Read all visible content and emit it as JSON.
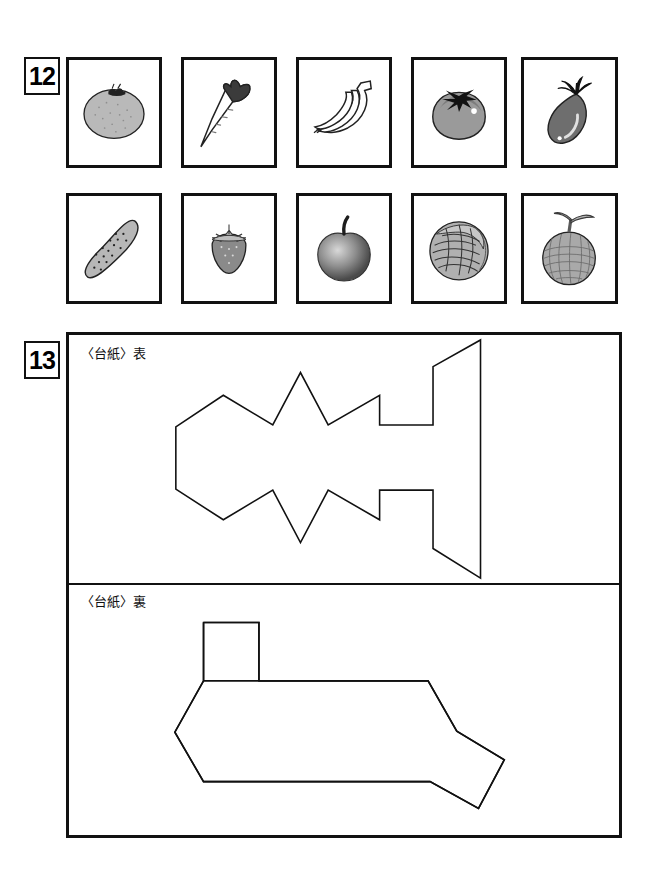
{
  "page": {
    "width": 650,
    "height": 890,
    "background": "#ffffff",
    "ink": "#111111"
  },
  "questions": [
    {
      "number": "12",
      "type": "picture-card-grid",
      "rows": 2,
      "columns": 5,
      "cards": [
        {
          "id": "card-orange",
          "icon": "orange-icon",
          "label": "orange",
          "row": 1,
          "col": 1
        },
        {
          "id": "card-carrot",
          "icon": "carrot-icon",
          "label": "carrot",
          "row": 1,
          "col": 2
        },
        {
          "id": "card-bananas",
          "icon": "bananas-icon",
          "label": "bananas",
          "row": 1,
          "col": 3
        },
        {
          "id": "card-tomato",
          "icon": "tomato-icon",
          "label": "tomato",
          "row": 1,
          "col": 4
        },
        {
          "id": "card-eggplant",
          "icon": "eggplant-icon",
          "label": "eggplant",
          "row": 1,
          "col": 5
        },
        {
          "id": "card-cucumber",
          "icon": "cucumber-icon",
          "label": "cucumber",
          "row": 2,
          "col": 1
        },
        {
          "id": "card-strawberry",
          "icon": "strawberry-icon",
          "label": "strawberry",
          "row": 2,
          "col": 2
        },
        {
          "id": "card-apple",
          "icon": "apple-icon",
          "label": "apple",
          "row": 2,
          "col": 3
        },
        {
          "id": "card-cabbage",
          "icon": "cabbage-icon",
          "label": "cabbage",
          "row": 2,
          "col": 4
        },
        {
          "id": "card-melon",
          "icon": "melon-icon",
          "label": "melon",
          "row": 2,
          "col": 5
        }
      ]
    },
    {
      "number": "13",
      "type": "outline-shape-panels",
      "panels": [
        {
          "id": "panel-front",
          "label": "〈台紙〉表",
          "shape": "jagged-arrow-outline"
        },
        {
          "id": "panel-back",
          "label": "〈台紙〉裏",
          "shape": "stepped-hexagon-outline"
        }
      ]
    }
  ]
}
